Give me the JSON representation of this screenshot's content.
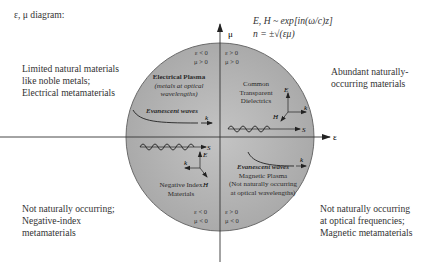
{
  "title": "ε, μ diagram:",
  "formula": {
    "line1": "E, H ~ exp[in(ω/c)z]",
    "line2": "n = ±√(εμ)"
  },
  "axes": {
    "x_label": "ε",
    "y_label": "μ"
  },
  "outer_labels": {
    "top_left": [
      "Limited natural materials",
      "like noble metals;",
      "Electrical metamaterials"
    ],
    "top_right": [
      "Abundant naturally-",
      "occurring materials"
    ],
    "bottom_left": [
      "Not naturally occurring;",
      "Negative-index",
      "metamaterials"
    ],
    "bottom_right": [
      "Not naturally occurring",
      "at optical frequencies;",
      "Magnetic metamaterials"
    ]
  },
  "quadrants": {
    "q2": {
      "signs": [
        "ε < 0",
        "μ > 0"
      ],
      "name": "Electrical Plasma",
      "sub": [
        "(metals at optical",
        "wavelengths)"
      ],
      "wave_label": "Evanescent waves",
      "vector_label": "k"
    },
    "q1": {
      "signs": [
        "ε > 0",
        "μ > 0"
      ],
      "name": [
        "Common",
        "Transparent",
        "Dielectrics"
      ],
      "vectors": [
        "E",
        "H",
        "k",
        "S"
      ]
    },
    "q3": {
      "signs": [
        "ε < 0",
        "μ < 0"
      ],
      "name": [
        "Negative Index",
        "Materials"
      ],
      "vectors": [
        "S",
        "E",
        "k",
        "H"
      ]
    },
    "q4": {
      "signs": [
        "ε > 0",
        "μ < 0"
      ],
      "wave_label": "Evanescent waves",
      "name": "Magnetic Plasma",
      "sub": [
        "(Not naturally occurring",
        "at optical wavelengths)"
      ],
      "vector_label": "k"
    }
  },
  "colors": {
    "circle_fill": "#b8b8b8",
    "circle_stroke": "#6a6a6a",
    "axis": "#333333",
    "background": "#ffffff"
  }
}
